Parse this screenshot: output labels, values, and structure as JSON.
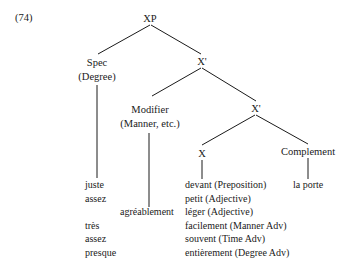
{
  "example_number": "(74)",
  "tree": {
    "root": "XP",
    "spec": {
      "label": "Spec",
      "sublabel": "(Degree)"
    },
    "xbar_upper": "X'",
    "modifier": {
      "label": "Modifier",
      "sublabel": "(Manner, etc.)"
    },
    "xbar_lower": "X'",
    "head": "X",
    "complement": "Complement"
  },
  "spec_words": [
    "juste",
    "assez",
    "",
    "très",
    "assez",
    "presque"
  ],
  "modifier_words": [
    "agréablement"
  ],
  "head_words": [
    "devant (Preposition)",
    "petit (Adjective)",
    "léger (Adjective)",
    "facilement (Manner Adv)",
    "souvent (Time Adv)",
    "entièrement (Degree Adv)"
  ],
  "complement_words": [
    "la porte"
  ]
}
